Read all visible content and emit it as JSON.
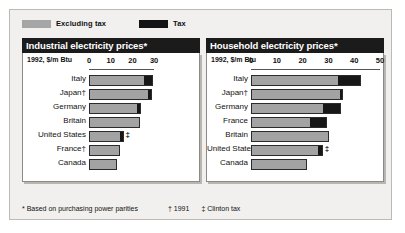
{
  "legend": {
    "items": [
      {
        "label": "Excluding tax",
        "color": "#a6a6a6",
        "key": "excluding-tax"
      },
      {
        "label": "Tax",
        "color": "#141414",
        "key": "tax"
      }
    ]
  },
  "footnotes": {
    "asterisk": "* Based on purchasing power parities",
    "dagger": "† 1991",
    "double_dagger": "‡ Clinton tax"
  },
  "panels": [
    {
      "key": "industrial",
      "title": "Industrial electricity prices*",
      "unit_label": "1992, $/m Btu"
    },
    {
      "key": "household",
      "title": "Household electricity prices*",
      "unit_label": "1992, $/m Btu"
    }
  ],
  "chart_data": [
    {
      "type": "bar",
      "orientation": "horizontal",
      "stacked": true,
      "title": "Industrial electricity prices*",
      "subtitle": "",
      "xlabel": "1992, $/m Btu",
      "ylabel": "",
      "xlim": [
        0,
        30
      ],
      "ticks": [
        0,
        10,
        20,
        30
      ],
      "grid": false,
      "legend_position": "top",
      "categories": [
        "Italy",
        "Japan†",
        "Germany",
        "Britain",
        "United States",
        "France†",
        "Canada"
      ],
      "marks": [
        "",
        "",
        "",
        "",
        "‡",
        "",
        ""
      ],
      "series": [
        {
          "name": "Excluding tax",
          "color": "#a3a3a3",
          "values": [
            25.0,
            26.5,
            21.5,
            22.5,
            14.0,
            13.5,
            12.0
          ]
        },
        {
          "name": "Tax",
          "color": "#171717",
          "values": [
            3.5,
            1.5,
            1.5,
            0.0,
            1.0,
            0.0,
            0.0
          ]
        }
      ],
      "totals": [
        28.5,
        28.0,
        23.0,
        22.5,
        15.0,
        13.5,
        12.0
      ]
    },
    {
      "type": "bar",
      "orientation": "horizontal",
      "stacked": true,
      "title": "Household electricity prices*",
      "subtitle": "",
      "xlabel": "1992, $/m Btu",
      "ylabel": "",
      "xlim": [
        0,
        50
      ],
      "ticks": [
        0,
        10,
        20,
        30,
        40,
        50
      ],
      "grid": false,
      "legend_position": "top",
      "categories": [
        "Italy",
        "Japan†",
        "Germany",
        "France",
        "Britain",
        "United States",
        "Canada"
      ],
      "marks": [
        "",
        "",
        "",
        "",
        "",
        "‡",
        ""
      ],
      "series": [
        {
          "name": "Excluding tax",
          "color": "#a3a3a3",
          "values": [
            33.5,
            34.0,
            27.5,
            22.5,
            29.5,
            25.5,
            21.0
          ]
        },
        {
          "name": "Tax",
          "color": "#171717",
          "values": [
            8.5,
            1.0,
            6.5,
            6.0,
            0.0,
            1.5,
            0.0
          ]
        }
      ],
      "totals": [
        42.0,
        35.0,
        34.0,
        28.5,
        29.5,
        27.0,
        21.0
      ]
    }
  ]
}
